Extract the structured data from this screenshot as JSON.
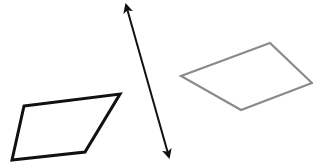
{
  "diagram": {
    "width": 313,
    "height": 162,
    "background": "#ffffff",
    "shapes": [
      {
        "id": "black-parallelogram",
        "type": "quadrilateral",
        "stroke": "#111111",
        "stroke_width": 3,
        "points": [
          [
            24,
            106
          ],
          [
            120,
            94
          ],
          [
            85,
            152
          ],
          [
            12,
            160
          ]
        ]
      },
      {
        "id": "gray-parallelogram",
        "type": "quadrilateral",
        "stroke": "#8a8a8a",
        "stroke_width": 2.2,
        "points": [
          [
            181,
            76
          ],
          [
            270,
            43
          ],
          [
            312,
            83
          ],
          [
            241,
            110
          ]
        ]
      },
      {
        "id": "double-arrow-line",
        "type": "double-headed-arrow",
        "stroke": "#111111",
        "stroke_width": 2,
        "from": [
          126,
          5
        ],
        "to": [
          169,
          157
        ]
      }
    ]
  }
}
